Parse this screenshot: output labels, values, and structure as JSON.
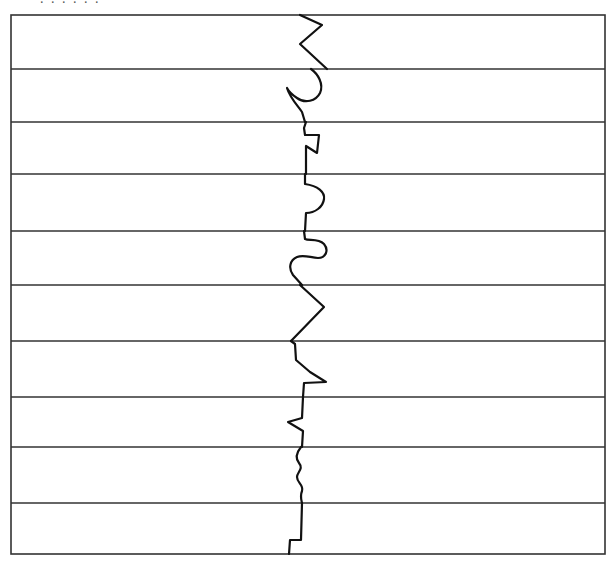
{
  "diagram": {
    "title": "",
    "frame": {
      "x": 11,
      "y": 15,
      "width": 594,
      "height": 539,
      "stroke": "#333333"
    },
    "band_boundaries_y": [
      15,
      69,
      122,
      174,
      231,
      285,
      341,
      397,
      447,
      503,
      554
    ],
    "band_count": 10,
    "line_color": "#111111",
    "divider_color": "#333333",
    "background": "#ffffff",
    "bands": [
      {
        "index": 1,
        "pattern": "zigzag",
        "path": "M300,15 L322,25 L300,44 L327,69"
      },
      {
        "index": 2,
        "pattern": "hook-curve",
        "path": "M311,69 C318,74 324,84 320,93 C316,101 305,104 297,98 C291,94 288,90 287,88 C290,98 298,106 302,112 L305,122"
      },
      {
        "index": 3,
        "pattern": "square-notch",
        "path": "M306,122 L304,128 L305,135 L319,135 L317,153 L306,146 L306,174"
      },
      {
        "index": 4,
        "pattern": "bump-curve",
        "path": "M305,174 L305,184 C318,186 325,192 324,199 C323,207 315,213 306,213 L305,231"
      },
      {
        "index": 5,
        "pattern": "s-curve",
        "path": "M304,231 L305,239 C309,241 318,238 324,244 C329,250 326,258 318,258 C311,258 304,254 297,257 C290,260 288,268 293,275 L302,285"
      },
      {
        "index": 6,
        "pattern": "zigzag",
        "path": "M300,285 L324,307 L291,341"
      },
      {
        "index": 7,
        "pattern": "slant-notch",
        "path": "M291,341 L295,344 L296,360 L310,372 L326,382 L304,383 L303,397"
      },
      {
        "index": 8,
        "pattern": "small-zigzag",
        "path": "M303,397 L302,418 L288,422 L303,431 L302,447"
      },
      {
        "index": 9,
        "pattern": "wave",
        "path": "M301,447 C297,452 295,458 299,463 C304,469 297,472 297,477 C297,483 304,485 302,491 C300,496 301,499 302,503"
      },
      {
        "index": 10,
        "pattern": "step",
        "path": "M302,503 L301,540 L290,540 L289,554"
      }
    ],
    "top_cutoff_text": ". . . . . ."
  }
}
